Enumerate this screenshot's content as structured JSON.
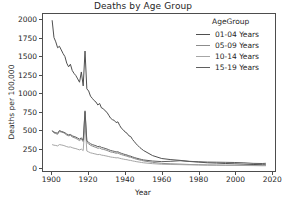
{
  "chart_data": {
    "type": "line",
    "title": "Deaths by Age Group",
    "xlabel": "Year",
    "ylabel": "Deaths per 100,000",
    "xlim": [
      1895,
      2022
    ],
    "ylim": [
      -60,
      2080
    ],
    "xticks": [
      1900,
      1920,
      1940,
      1960,
      1980,
      2000,
      2020
    ],
    "yticks": [
      0,
      250,
      500,
      750,
      1000,
      1250,
      1500,
      1750,
      2000
    ],
    "grid": false,
    "legend_position": "upper right",
    "legend_title": "AgeGroup",
    "series": [
      {
        "name": "01-04 Years",
        "color": "#4f4f4f",
        "x": [
          1900,
          1901,
          1902,
          1903,
          1904,
          1905,
          1906,
          1907,
          1908,
          1909,
          1910,
          1911,
          1912,
          1913,
          1914,
          1915,
          1916,
          1917,
          1918,
          1919,
          1920,
          1921,
          1922,
          1923,
          1924,
          1925,
          1926,
          1927,
          1928,
          1929,
          1930,
          1931,
          1932,
          1933,
          1934,
          1935,
          1936,
          1937,
          1938,
          1939,
          1940,
          1941,
          1942,
          1943,
          1944,
          1945,
          1946,
          1947,
          1948,
          1949,
          1950,
          1955,
          1960,
          1965,
          1970,
          1975,
          1980,
          1985,
          1990,
          1995,
          2000,
          2005,
          2010,
          2015,
          2017
        ],
        "y": [
          1995,
          1760,
          1700,
          1620,
          1640,
          1590,
          1540,
          1500,
          1410,
          1360,
          1395,
          1310,
          1270,
          1240,
          1195,
          1150,
          1290,
          1100,
          1575,
          1060,
          1030,
          960,
          930,
          900,
          880,
          840,
          860,
          800,
          790,
          760,
          740,
          700,
          660,
          640,
          630,
          600,
          610,
          560,
          520,
          500,
          470,
          455,
          420,
          410,
          370,
          340,
          310,
          285,
          260,
          240,
          220,
          150,
          110,
          95,
          85,
          70,
          62,
          52,
          48,
          42,
          38,
          33,
          29,
          26,
          25
        ]
      },
      {
        "name": "05-09 Years",
        "color": "#8c8c8c",
        "x": [
          1900,
          1901,
          1902,
          1903,
          1904,
          1905,
          1906,
          1907,
          1908,
          1909,
          1910,
          1911,
          1912,
          1913,
          1914,
          1915,
          1916,
          1917,
          1918,
          1919,
          1920,
          1921,
          1922,
          1923,
          1924,
          1925,
          1926,
          1927,
          1928,
          1929,
          1930,
          1931,
          1932,
          1933,
          1934,
          1935,
          1936,
          1937,
          1938,
          1939,
          1940,
          1941,
          1942,
          1943,
          1944,
          1945,
          1946,
          1947,
          1948,
          1949,
          1950,
          1955,
          1960,
          1965,
          1970,
          1975,
          1980,
          1985,
          1990,
          1995,
          2000,
          2005,
          2010,
          2015,
          2017
        ],
        "y": [
          490,
          460,
          450,
          440,
          480,
          470,
          465,
          450,
          430,
          420,
          425,
          405,
          395,
          385,
          370,
          355,
          375,
          340,
          745,
          330,
          310,
          290,
          280,
          270,
          262,
          250,
          255,
          240,
          235,
          228,
          220,
          210,
          200,
          195,
          190,
          182,
          185,
          172,
          163,
          155,
          148,
          143,
          132,
          128,
          118,
          110,
          102,
          96,
          90,
          84,
          78,
          58,
          44,
          38,
          34,
          29,
          26,
          23,
          21,
          19,
          17,
          15,
          14,
          13,
          13
        ]
      },
      {
        "name": "10-14 Years",
        "color": "#a6a6a6",
        "x": [
          1900,
          1901,
          1902,
          1903,
          1904,
          1905,
          1906,
          1907,
          1908,
          1909,
          1910,
          1911,
          1912,
          1913,
          1914,
          1915,
          1916,
          1917,
          1918,
          1919,
          1920,
          1921,
          1922,
          1923,
          1924,
          1925,
          1926,
          1927,
          1928,
          1929,
          1930,
          1931,
          1932,
          1933,
          1934,
          1935,
          1936,
          1937,
          1938,
          1939,
          1940,
          1941,
          1942,
          1943,
          1944,
          1945,
          1946,
          1947,
          1948,
          1949,
          1950,
          1955,
          1960,
          1965,
          1970,
          1975,
          1980,
          1985,
          1990,
          1995,
          2000,
          2005,
          2010,
          2015,
          2017
        ],
        "y": [
          300,
          292,
          288,
          282,
          300,
          295,
          290,
          282,
          272,
          265,
          268,
          258,
          250,
          245,
          236,
          228,
          238,
          218,
          580,
          212,
          200,
          188,
          182,
          176,
          170,
          163,
          166,
          157,
          153,
          148,
          143,
          137,
          131,
          127,
          124,
          119,
          121,
          113,
          107,
          102,
          97,
          94,
          87,
          84,
          78,
          73,
          68,
          64,
          60,
          56,
          52,
          40,
          32,
          29,
          27,
          24,
          22,
          20,
          19,
          18,
          17,
          16,
          15,
          14,
          14
        ]
      },
      {
        "name": "15-19 Years",
        "color": "#5f5f5f",
        "x": [
          1900,
          1901,
          1902,
          1903,
          1904,
          1905,
          1906,
          1907,
          1908,
          1909,
          1910,
          1911,
          1912,
          1913,
          1914,
          1915,
          1916,
          1917,
          1918,
          1919,
          1920,
          1921,
          1922,
          1923,
          1924,
          1925,
          1926,
          1927,
          1928,
          1929,
          1930,
          1931,
          1932,
          1933,
          1934,
          1935,
          1936,
          1937,
          1938,
          1939,
          1940,
          1941,
          1942,
          1943,
          1944,
          1945,
          1946,
          1947,
          1948,
          1949,
          1950,
          1955,
          1960,
          1965,
          1970,
          1975,
          1980,
          1985,
          1990,
          1995,
          2000,
          2005,
          2010,
          2015,
          2017
        ],
        "y": [
          488,
          470,
          462,
          455,
          492,
          480,
          472,
          462,
          444,
          432,
          438,
          420,
          410,
          402,
          388,
          374,
          392,
          360,
          760,
          352,
          330,
          312,
          300,
          292,
          284,
          272,
          276,
          262,
          256,
          248,
          240,
          230,
          220,
          214,
          208,
          200,
          202,
          190,
          180,
          172,
          164,
          158,
          147,
          142,
          132,
          124,
          116,
          110,
          103,
          97,
          91,
          76,
          68,
          72,
          80,
          72,
          66,
          62,
          60,
          58,
          56,
          52,
          44,
          42,
          45
        ]
      }
    ]
  }
}
